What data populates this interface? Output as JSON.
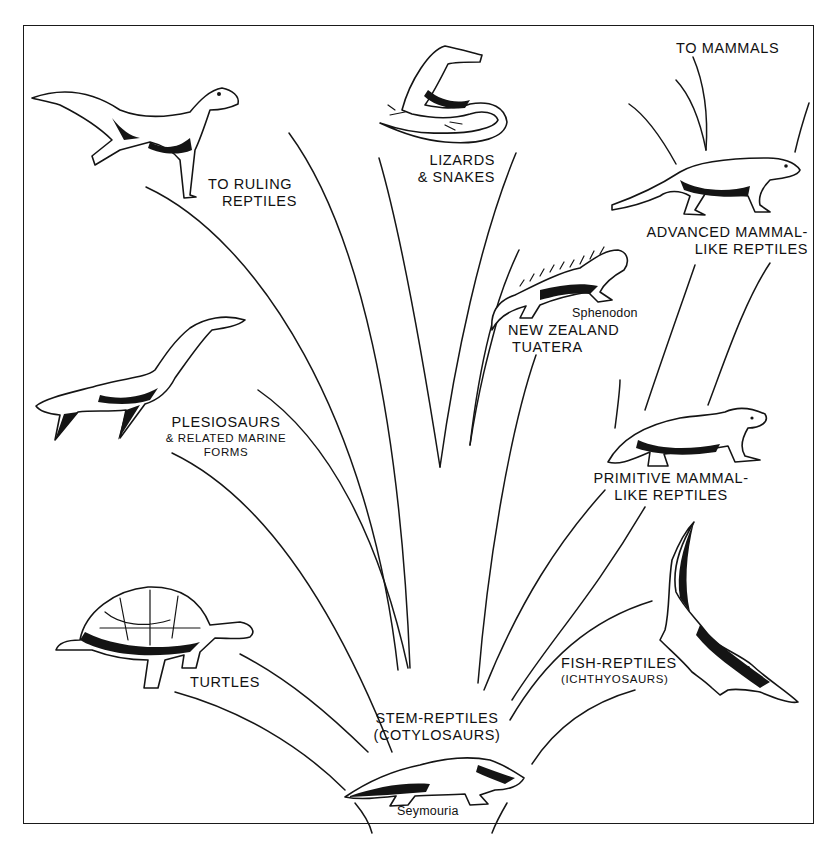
{
  "figure": {
    "root": {
      "label_line1": "STEM-REPTILES",
      "label_line2": "(COTYLOSAURS)",
      "example": "Seymouria"
    },
    "groups": [
      {
        "id": "ruling-reptiles",
        "line1": "TO RULING",
        "line2": "REPTILES"
      },
      {
        "id": "lizards-snakes",
        "line1": "LIZARDS",
        "line2": "& SNAKES"
      },
      {
        "id": "mammals",
        "line1": "TO MAMMALS"
      },
      {
        "id": "advanced-mammal-like",
        "line1": "ADVANCED MAMMAL-",
        "line2": "LIKE REPTILES"
      },
      {
        "id": "tuatera",
        "genus": "Sphenodon",
        "line1": "NEW ZEALAND",
        "line2": "TUATERA"
      },
      {
        "id": "plesiosaurs",
        "line1": "PLESIOSAURS",
        "line2": "& RELATED MARINE",
        "line3": "FORMS"
      },
      {
        "id": "primitive-mammal-like",
        "line1": "PRIMITIVE MAMMAL-",
        "line2": "LIKE REPTILES"
      },
      {
        "id": "turtles",
        "line1": "TURTLES"
      },
      {
        "id": "ichthyosaurs",
        "line1": "FISH-REPTILES",
        "line2": "(ICHTHYOSAURS)"
      }
    ],
    "illustrations": [
      "theropod-dinosaur",
      "lizard",
      "advanced-therapsid",
      "tuatara",
      "plesiosaur",
      "primitive-therapsid",
      "tortoise",
      "ichthyosaur",
      "seymouria"
    ]
  }
}
